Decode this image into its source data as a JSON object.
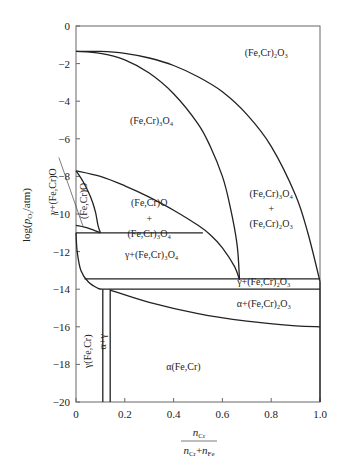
{
  "chart_data": {
    "type": "line",
    "title": "",
    "xlabel": {
      "numerator": "n",
      "numerator_sub": "Cr",
      "denominator": "n",
      "denominator_sub1": "Cr",
      "plus": "+",
      "denominator_n2": "n",
      "denominator_sub2": "Fe"
    },
    "ylabel": {
      "pre": "log(",
      "p": "p",
      "sub": "O",
      "subsub": "2",
      "post": "/atm)"
    },
    "xlim": [
      0,
      1.0
    ],
    "ylim": [
      -20,
      0
    ],
    "xticks": [
      0,
      0.2,
      0.4,
      0.6,
      0.8,
      1.0
    ],
    "xtick_labels": [
      "0",
      "0.2",
      "0.4",
      "0.6",
      "0.8",
      "1.0"
    ],
    "yticks": [
      0,
      -2,
      -4,
      -6,
      -8,
      -10,
      -12,
      -14,
      -16,
      -18,
      -20
    ],
    "ytick_labels": [
      "0",
      "−2",
      "−4",
      "−6",
      "−8",
      "−10",
      "−12",
      "−14",
      "−16",
      "−18",
      "−20"
    ],
    "grid": false,
    "boundaries": [
      {
        "name": "spinel-corundum-upper",
        "points": [
          [
            0,
            -1.35
          ],
          [
            0.1,
            -1.35
          ],
          [
            0.2,
            -1.45
          ],
          [
            0.3,
            -1.7
          ],
          [
            0.4,
            -2.1
          ],
          [
            0.5,
            -2.7
          ],
          [
            0.6,
            -3.5
          ],
          [
            0.7,
            -4.7
          ],
          [
            0.8,
            -6.4
          ],
          [
            0.9,
            -9.0
          ],
          [
            0.95,
            -11.0
          ],
          [
            1.0,
            -13.6
          ]
        ]
      },
      {
        "name": "spinel-corundum-lower",
        "points": [
          [
            0,
            -1.35
          ],
          [
            0.1,
            -1.45
          ],
          [
            0.2,
            -1.8
          ],
          [
            0.3,
            -2.5
          ],
          [
            0.4,
            -3.6
          ],
          [
            0.5,
            -5.2
          ],
          [
            0.55,
            -6.4
          ],
          [
            0.6,
            -8.0
          ],
          [
            0.63,
            -9.5
          ],
          [
            0.66,
            -11.6
          ],
          [
            0.67,
            -13.5
          ]
        ]
      },
      {
        "name": "wustite-spinel-upper",
        "points": [
          [
            0,
            -7.7
          ],
          [
            0.1,
            -8.0
          ],
          [
            0.2,
            -8.5
          ],
          [
            0.3,
            -9.1
          ],
          [
            0.4,
            -9.8
          ],
          [
            0.5,
            -10.6
          ],
          [
            0.55,
            -11.1
          ],
          [
            0.6,
            -11.8
          ],
          [
            0.65,
            -12.8
          ],
          [
            0.67,
            -13.5
          ]
        ]
      },
      {
        "name": "wustite-region-right",
        "points": [
          [
            0,
            -7.7
          ],
          [
            0.03,
            -8.3
          ],
          [
            0.06,
            -9.1
          ],
          [
            0.08,
            -9.9
          ],
          [
            0.09,
            -10.6
          ],
          [
            0.1,
            -11.0
          ]
        ]
      },
      {
        "name": "wustite-lower",
        "points": [
          [
            0,
            -10.6
          ],
          [
            0.05,
            -10.75
          ],
          [
            0.1,
            -11.0
          ]
        ]
      },
      {
        "name": "gamma-spinel-top",
        "points": [
          [
            0,
            -11.0
          ],
          [
            0.52,
            -11.0
          ]
        ]
      },
      {
        "name": "gamma-corundum-top",
        "points": [
          [
            0.035,
            -13.45
          ],
          [
            1.0,
            -13.45
          ]
        ]
      },
      {
        "name": "gamma-corundum-bottom",
        "points": [
          [
            0.11,
            -14.0
          ],
          [
            1.0,
            -14.0
          ]
        ]
      },
      {
        "name": "alpha-corundum-bottom",
        "points": [
          [
            0.14,
            -14.05
          ],
          [
            0.3,
            -14.7
          ],
          [
            0.5,
            -15.3
          ],
          [
            0.7,
            -15.7
          ],
          [
            0.9,
            -15.95
          ],
          [
            1.0,
            -16.0
          ]
        ]
      },
      {
        "name": "gamma-metal-edge",
        "points": [
          [
            0,
            -11.0
          ],
          [
            0.005,
            -12.0
          ],
          [
            0.02,
            -13.0
          ],
          [
            0.05,
            -13.6
          ],
          [
            0.09,
            -13.95
          ],
          [
            0.11,
            -14.0
          ]
        ]
      },
      {
        "name": "gamma-alpha-left",
        "points": [
          [
            0.11,
            -14.0
          ],
          [
            0.11,
            -20
          ]
        ]
      },
      {
        "name": "gamma-alpha-right",
        "points": [
          [
            0.14,
            -14.0
          ],
          [
            0.14,
            -20
          ]
        ]
      },
      {
        "name": "right-edge-upper",
        "points": [
          [
            1.0,
            -13.6
          ],
          [
            1.0,
            -20
          ]
        ]
      }
    ],
    "annotations": [
      {
        "text": "(Fe,Cr)₂O₃",
        "x": 0.78,
        "y": -1.6
      },
      {
        "text": "(Fe,Cr)₃O₄",
        "x": 0.31,
        "y": -5.2
      },
      {
        "text": "(Fe,Cr)₃O₄",
        "x": 0.8,
        "y": -9.1
      },
      {
        "text": "+",
        "x": 0.8,
        "y": -9.9
      },
      {
        "text": "(Fe,Cr)₂O₃",
        "x": 0.8,
        "y": -10.7
      },
      {
        "text": "(Fe,Cr)O",
        "x": 0.3,
        "y": -9.6
      },
      {
        "text": "+",
        "x": 0.3,
        "y": -10.4
      },
      {
        "text": "(Fe,Cr)₃O₄",
        "x": 0.3,
        "y": -11.2
      },
      {
        "text": "γ+(Fe,Cr)₃O₄",
        "x": 0.31,
        "y": -12.35
      },
      {
        "text": "γ+(Fe,Cr)₂O₃",
        "x": 0.77,
        "y": -13.75
      },
      {
        "text": "α+(Fe,Cr)₂O₃",
        "x": 0.77,
        "y": -14.95
      },
      {
        "text": "α(Fe,Cr)",
        "x": 0.44,
        "y": -18.3
      },
      {
        "text": "(Fe,Cr)O",
        "x": 0.045,
        "y": -9.3,
        "rotate": -90
      },
      {
        "text": "γ+(Fe,Cr)O",
        "x": -0.08,
        "y": -8.8,
        "rotate": -90
      },
      {
        "text": "γ(Fe,Cr)",
        "x": 0.06,
        "y": -17.3,
        "rotate": -90
      },
      {
        "text": "α+γ",
        "x": 0.125,
        "y": -16.8,
        "rotate": -90
      }
    ]
  }
}
